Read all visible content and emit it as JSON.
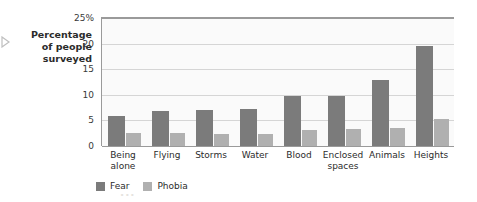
{
  "axis_label": {
    "line1": "Percentage",
    "line2": "of people",
    "line3": "surveyed",
    "pointer_icon": "right-arrow-icon"
  },
  "legend": {
    "fear": "Fear",
    "phobia": "Phobia"
  },
  "colors": {
    "fear": "#7b7b7b",
    "phobia": "#b0b0b0",
    "axis": "#9a9a9a",
    "grid": "#d5d5d5",
    "plot_background": "#fafafa"
  },
  "bleed_text": {
    "b1": "...",
    "b2": "...",
    "b3": "...",
    "b4": "..."
  },
  "chart_data": {
    "type": "bar",
    "title": "",
    "xlabel": "",
    "ylabel": "Percentage of people surveyed",
    "ylim": [
      0,
      25
    ],
    "yticks": [
      0,
      5,
      10,
      15,
      20,
      25
    ],
    "ytick_labels": [
      "0",
      "5",
      "10",
      "15",
      "20",
      "25%"
    ],
    "grid": true,
    "legend_position": "bottom-left",
    "categories": [
      "Being alone",
      "Flying",
      "Storms",
      "Water",
      "Blood",
      "Enclosed spaces",
      "Animals",
      "Heights"
    ],
    "category_lines": [
      [
        "Being",
        "alone"
      ],
      [
        "Flying"
      ],
      [
        "Storms"
      ],
      [
        "Water"
      ],
      [
        "Blood"
      ],
      [
        "Enclosed",
        "spaces"
      ],
      [
        "Animals"
      ],
      [
        "Heights"
      ]
    ],
    "series": [
      {
        "name": "Fear",
        "color": "#7b7b7b",
        "values": [
          5.8,
          6.9,
          7.0,
          7.2,
          9.7,
          9.7,
          12.9,
          19.5
        ]
      },
      {
        "name": "Phobia",
        "color": "#b0b0b0",
        "values": [
          2.6,
          2.5,
          2.3,
          2.4,
          3.2,
          3.4,
          3.5,
          5.3
        ]
      }
    ]
  }
}
